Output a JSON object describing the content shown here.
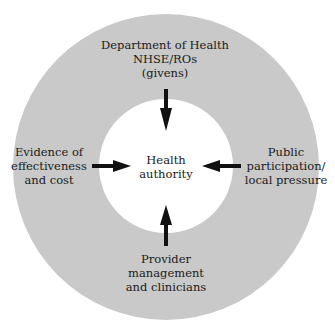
{
  "diagram": {
    "type": "concentric-influence-diagram",
    "colors": {
      "ring": "#c9c9c9",
      "inner": "#ffffff",
      "arrow": "#111111",
      "text": "#1a1a1a"
    },
    "center": {
      "lines": [
        "Health",
        "authority"
      ]
    },
    "influences": {
      "top": {
        "lines": [
          "Department of Health",
          "NHSE/ROs",
          "(givens)"
        ],
        "arrow_direction": "down"
      },
      "left": {
        "lines": [
          "Evidence of",
          "effectiveness",
          "and cost"
        ],
        "arrow_direction": "right"
      },
      "right": {
        "lines": [
          "Public",
          "participation/",
          "local pressure"
        ],
        "arrow_direction": "left"
      },
      "bottom": {
        "lines": [
          "Provider",
          "management",
          "and clinicians"
        ],
        "arrow_direction": "up"
      }
    }
  }
}
